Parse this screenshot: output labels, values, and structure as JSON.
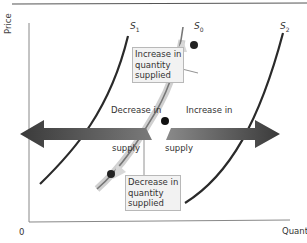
{
  "diagram": {
    "type": "supply-shift",
    "axes": {
      "x_label": "Quantity",
      "y_label": "Price",
      "origin": "0"
    },
    "curves": [
      {
        "id": "S1",
        "letter": "S",
        "subscript": "1"
      },
      {
        "id": "S0",
        "letter": "S",
        "subscript": "0"
      },
      {
        "id": "S2",
        "letter": "S",
        "subscript": "2"
      }
    ],
    "arrows": {
      "left": {
        "line1": "Decrease in",
        "line2": "supply"
      },
      "right": {
        "line1": "Increase in",
        "line2": "supply"
      }
    },
    "callouts": {
      "upper": {
        "line1": "Increase in",
        "line2": "quantity",
        "line3": "supplied"
      },
      "lower": {
        "line1": "Decrease in",
        "line2": "quantity",
        "line3": "supplied"
      }
    },
    "colors": {
      "curve": "#2a2a2a",
      "arrow": "#3a3a3a",
      "highlight_curve": "#c8c8c8",
      "box_bg": "#f2f2f2",
      "point": "#222222"
    }
  }
}
